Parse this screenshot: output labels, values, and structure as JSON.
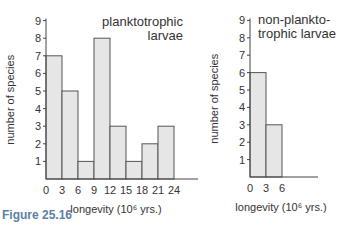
{
  "figure_label": "Figure 25.16",
  "chart_data": [
    {
      "type": "bar",
      "title": "planktotrophic larvae",
      "title_lines": [
        "planktotrophic",
        "larvae"
      ],
      "xlabel": "longevity (10⁶ yrs.)",
      "ylabel": "number of species",
      "x_ticks": [
        "0",
        "3",
        "6",
        "9",
        "12",
        "15",
        "18",
        "21",
        "24"
      ],
      "y_ticks": [
        "1",
        "2",
        "3",
        "4",
        "5",
        "6",
        "7",
        "8",
        "9"
      ],
      "bins": [
        [
          0,
          3
        ],
        [
          3,
          6
        ],
        [
          6,
          9
        ],
        [
          9,
          12
        ],
        [
          12,
          15
        ],
        [
          15,
          18
        ],
        [
          18,
          21
        ],
        [
          21,
          24
        ]
      ],
      "values": [
        7,
        5,
        1,
        8,
        3,
        1,
        2,
        3
      ],
      "ylim": [
        0,
        9
      ],
      "xlim": [
        0,
        24
      ],
      "bar_color": "#e6e6e6",
      "grid": false
    },
    {
      "type": "bar",
      "title": "non-planktotrophic larvae",
      "title_lines": [
        "non-plankto-",
        "trophic larvae"
      ],
      "xlabel": "longevity (10⁶ yrs.)",
      "ylabel": "number of species",
      "x_ticks": [
        "0",
        "3",
        "6"
      ],
      "y_ticks": [
        "1",
        "2",
        "3",
        "4",
        "5",
        "6",
        "7",
        "8",
        "9"
      ],
      "bins": [
        [
          0,
          3
        ],
        [
          3,
          6
        ]
      ],
      "values": [
        6,
        3
      ],
      "ylim": [
        0,
        9
      ],
      "bar_color": "#e6e6e6",
      "grid": false
    }
  ]
}
